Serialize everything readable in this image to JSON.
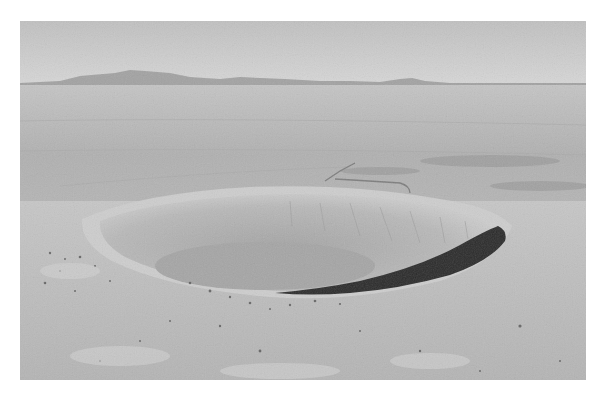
{
  "image": {
    "subject": "Aerial photograph of a large impact crater in a flat desert plain",
    "colors": {
      "sky_top": "#c2c2c2",
      "sky_horizon": "#d4d4d4",
      "mountains": "#9c9c9c",
      "plain": "#b2b2b2",
      "crater_wall": "#bdbdbd",
      "crater_floor": "#a6a6a6",
      "crater_shadow": "#2a2a2a",
      "foreground": "#bcbcbc"
    }
  }
}
